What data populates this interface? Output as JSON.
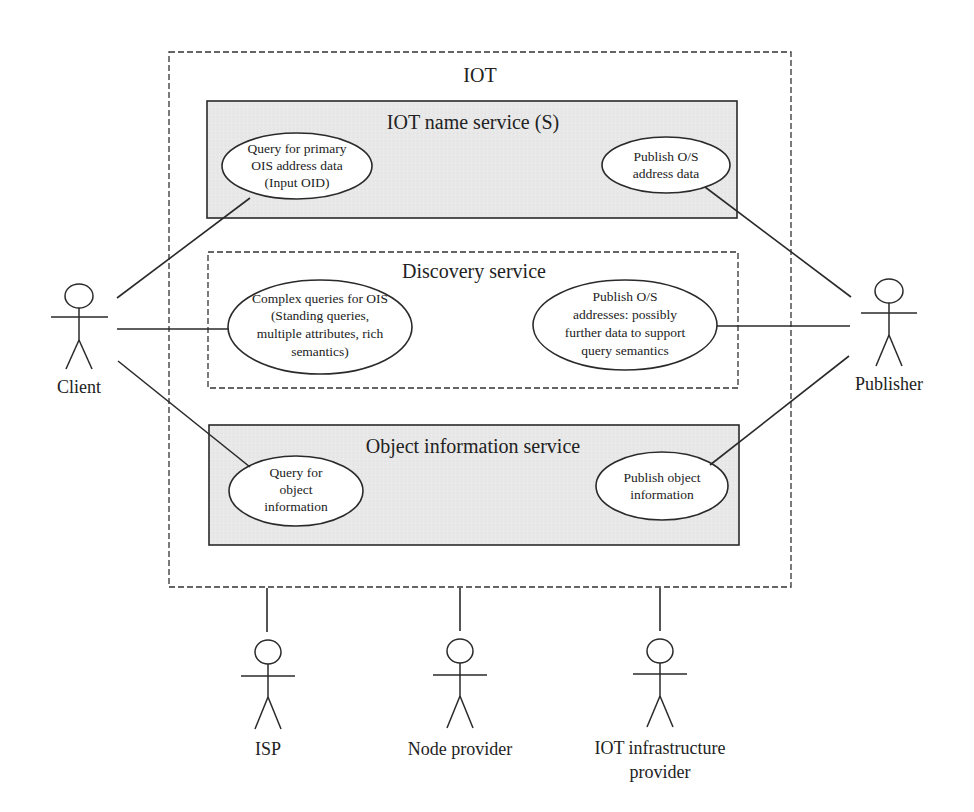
{
  "diagram": {
    "type": "use-case",
    "system": {
      "title": "IOT",
      "services": [
        {
          "title": "IOT name service (S)",
          "style": "shaded",
          "use_cases": [
            {
              "lines": [
                "Query for primary",
                "OIS address data",
                "(Input OID)"
              ]
            },
            {
              "lines": [
                "Publish O/S",
                "address data"
              ]
            }
          ]
        },
        {
          "title": "Discovery service",
          "style": "dashed",
          "use_cases": [
            {
              "lines": [
                "Complex queries for OIS",
                "(Standing queries,",
                "multiple attributes, rich",
                "semantics)"
              ]
            },
            {
              "lines": [
                "Publish O/S",
                "addresses: possibly",
                "further data to support",
                "query semantics"
              ]
            }
          ]
        },
        {
          "title": "Object information service",
          "style": "shaded",
          "use_cases": [
            {
              "lines": [
                "Query for",
                "object",
                "information"
              ]
            },
            {
              "lines": [
                "Publish object",
                "information"
              ]
            }
          ]
        }
      ]
    },
    "actors": [
      {
        "name": "Client",
        "lines": [
          "Client"
        ]
      },
      {
        "name": "Publisher",
        "lines": [
          "Publisher"
        ]
      },
      {
        "name": "ISP",
        "lines": [
          "ISP"
        ]
      },
      {
        "name": "Node provider",
        "lines": [
          "Node provider"
        ]
      },
      {
        "name": "IOT infrastructure provider",
        "lines": [
          "IOT infrastructure",
          "provider"
        ]
      }
    ],
    "colors": {
      "shade": "#e6e6e6",
      "stroke": "#2a2a2a",
      "text": "#222222"
    }
  }
}
